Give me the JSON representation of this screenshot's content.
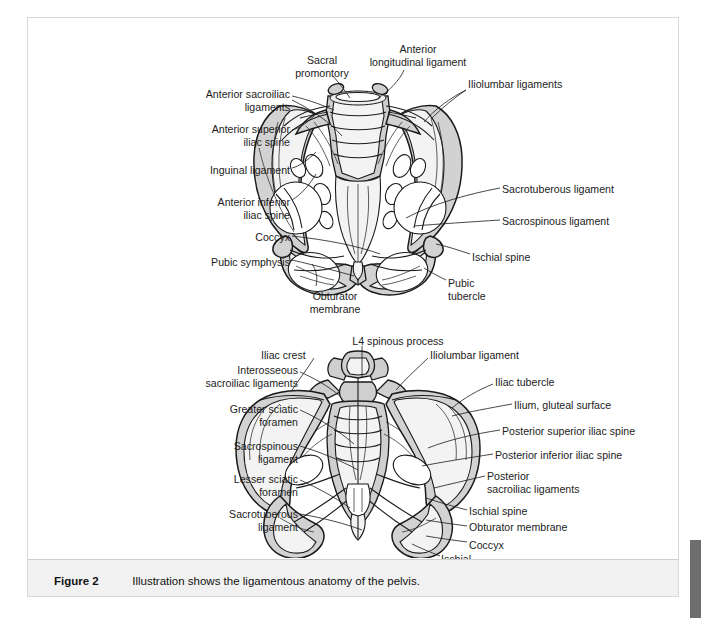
{
  "page": {
    "background": "#ffffff",
    "panel_border": "#d8d8d8"
  },
  "caption": {
    "number": "Figure 2",
    "text": "Illustration shows the ligamentous anatomy of the pelvis.",
    "background": "#f1f1f1"
  },
  "scrollbar": {
    "color": "#6e6e6e"
  },
  "figure": {
    "title": "Ligamentous anatomy of the pelvis",
    "bone_fill": "#d2d2d2",
    "highlight_fill": "#f2f2f2",
    "line_color": "#1a1a1a",
    "views": [
      {
        "name": "anterior-pelvis",
        "caption": "Anterior view of the pelvis"
      },
      {
        "name": "posterior-pelvis",
        "caption": "Posterior view of the pelvis"
      }
    ],
    "labels_top": [
      {
        "id": "sacral-promontory",
        "text": "Sacral\npromontory",
        "align": "center",
        "x": 246,
        "y": 36,
        "w": 96
      },
      {
        "id": "anterior-longitudinal-ligament",
        "text": "Anterior\nlongitudinal ligament",
        "align": "center",
        "x": 310,
        "y": 25,
        "w": 160
      },
      {
        "id": "iliolumbar-ligaments",
        "text": "Iliolumbar ligaments",
        "align": "left",
        "x": 440,
        "y": 60,
        "w": 160
      },
      {
        "id": "anterior-sacroiliac-ligaments",
        "text": "Anterior sacroiliac\nligaments",
        "align": "right",
        "x": 110,
        "y": 70,
        "w": 152
      },
      {
        "id": "anterior-superior-iliac-spine",
        "text": "Anterior superior\niliac spine",
        "align": "right",
        "x": 110,
        "y": 105,
        "w": 152
      },
      {
        "id": "inguinal-ligament",
        "text": "Inguinal ligament",
        "align": "right",
        "x": 110,
        "y": 146,
        "w": 152
      },
      {
        "id": "anterior-inferior-iliac-spine",
        "text": "Anterior inferior\niliac spine",
        "align": "right",
        "x": 110,
        "y": 178,
        "w": 152
      },
      {
        "id": "coccyx-anterior",
        "text": "Coccyx",
        "align": "right",
        "x": 150,
        "y": 213,
        "w": 112
      },
      {
        "id": "pubic-symphysis",
        "text": "Pubic symphysis",
        "align": "right",
        "x": 122,
        "y": 238,
        "w": 140
      },
      {
        "id": "obturator-membrane",
        "text": "Obturator\nmembrane",
        "align": "center",
        "x": 264,
        "y": 272,
        "w": 86
      },
      {
        "id": "sacrotuberous-ligament-ant",
        "text": "Sacrotuberous ligament",
        "align": "left",
        "x": 474,
        "y": 165,
        "w": 170
      },
      {
        "id": "sacrospinous-ligament-ant",
        "text": "Sacrospinous ligament",
        "align": "left",
        "x": 474,
        "y": 197,
        "w": 170
      },
      {
        "id": "ischial-spine-ant",
        "text": "Ischial spine",
        "align": "left",
        "x": 444,
        "y": 233,
        "w": 140
      },
      {
        "id": "pubic-tubercle",
        "text": "Pubic\ntubercle",
        "align": "left",
        "x": 420,
        "y": 259,
        "w": 80
      }
    ],
    "labels_bottom": [
      {
        "id": "l4-spinous-process",
        "text": "L4 spinous process",
        "align": "center",
        "x": 306,
        "y": 317,
        "w": 128
      },
      {
        "id": "iliac-crest",
        "text": "Iliac crest",
        "align": "left",
        "x": 233,
        "y": 331,
        "w": 90
      },
      {
        "id": "iliolumbar-ligament",
        "text": "Iliolumbar ligament",
        "align": "left",
        "x": 402,
        "y": 331,
        "w": 140
      },
      {
        "id": "interosseous-sacroiliac-ligaments",
        "text": "Interosseous\nsacroiliac ligaments",
        "align": "right",
        "x": 120,
        "y": 346,
        "w": 150
      },
      {
        "id": "iliac-tubercle",
        "text": "Iliac tubercle",
        "align": "left",
        "x": 467,
        "y": 358,
        "w": 120
      },
      {
        "id": "greater-sciatic-foramen",
        "text": "Greater sciatic\nforamen",
        "align": "right",
        "x": 126,
        "y": 385,
        "w": 144
      },
      {
        "id": "ilium-gluteal-surface",
        "text": "Ilium, gluteal surface",
        "align": "left",
        "x": 486,
        "y": 381,
        "w": 160
      },
      {
        "id": "posterior-superior-iliac-spine",
        "text": "Posterior superior iliac spine",
        "align": "left",
        "x": 474,
        "y": 407,
        "w": 184
      },
      {
        "id": "sacrospinous-ligament-post",
        "text": "Sacrospinous\nligament",
        "align": "right",
        "x": 140,
        "y": 422,
        "w": 130
      },
      {
        "id": "posterior-inferior-iliac-spine",
        "text": "Posterior inferior iliac spine",
        "align": "left",
        "x": 467,
        "y": 431,
        "w": 184
      },
      {
        "id": "posterior-sacroiliac-ligaments",
        "text": "Posterior\nsacroiliac ligaments",
        "align": "left",
        "x": 459,
        "y": 452,
        "w": 150
      },
      {
        "id": "lesser-sciatic-foramen",
        "text": "Lesser sciatic\nforamen",
        "align": "right",
        "x": 140,
        "y": 455,
        "w": 130
      },
      {
        "id": "ischial-spine-post",
        "text": "Ischial spine",
        "align": "left",
        "x": 441,
        "y": 487,
        "w": 120
      },
      {
        "id": "sacrotuberous-ligament-post",
        "text": "Sacrotuberous\nligament",
        "align": "right",
        "x": 132,
        "y": 490,
        "w": 138
      },
      {
        "id": "obturator-membrane-post",
        "text": "Obturator membrane",
        "align": "left",
        "x": 441,
        "y": 503,
        "w": 160
      },
      {
        "id": "coccyx-posterior",
        "text": "Coccyx",
        "align": "left",
        "x": 441,
        "y": 521,
        "w": 90
      },
      {
        "id": "ischial-tuberosity",
        "text": "Ischial\ntuberosity",
        "align": "left",
        "x": 413,
        "y": 535,
        "w": 80
      }
    ]
  }
}
